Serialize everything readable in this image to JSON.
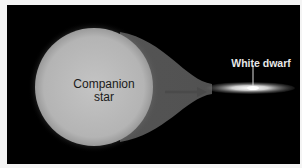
{
  "diagram": {
    "title": "",
    "labels": {
      "companion_star": [
        "Companion",
        "star"
      ],
      "white_dwarf": "White dwarf"
    },
    "colors": {
      "background": "#000000",
      "border": "#f4f4f4",
      "star_fill": "#b8b8b8",
      "text_dark": "#1a1a1a",
      "text_light": "#e8e8e8"
    },
    "elements": [
      {
        "id": "companion-star",
        "shape": "circle",
        "cx": 94,
        "cy": 87,
        "r": 59
      },
      {
        "id": "mass-stream",
        "shape": "funnel",
        "from_x": 150,
        "to_x": 210,
        "y": 90
      },
      {
        "id": "flow-arrow",
        "shape": "arrow",
        "from_x": 165,
        "to_x": 205,
        "y": 92
      },
      {
        "id": "accretion-disk",
        "shape": "ellipse",
        "cx": 250,
        "cy": 88,
        "rx": 45,
        "ry": 6
      },
      {
        "id": "leader-line",
        "shape": "line",
        "x": 253,
        "y1": 64,
        "y2": 86
      }
    ]
  }
}
